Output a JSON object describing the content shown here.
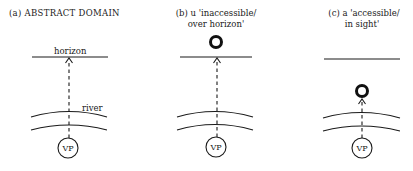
{
  "figure": {
    "panels": [
      {
        "id": "a",
        "title_line1": "(a)  ABSTRACT DOMAIN",
        "title_line2": "",
        "horizon_label": "horizon",
        "river_label": "river",
        "viewpoint_label": "VP",
        "object": "none"
      },
      {
        "id": "b",
        "title_line1": "(b) u 'inaccessible/",
        "title_line2": "over horizon'",
        "horizon_label": "",
        "river_label": "",
        "viewpoint_label": "VP",
        "object": "above-horizon"
      },
      {
        "id": "c",
        "title_line1": "(c) a 'accessible/",
        "title_line2": "in sight'",
        "horizon_label": "",
        "river_label": "",
        "viewpoint_label": "VP",
        "object": "below-horizon"
      }
    ]
  }
}
